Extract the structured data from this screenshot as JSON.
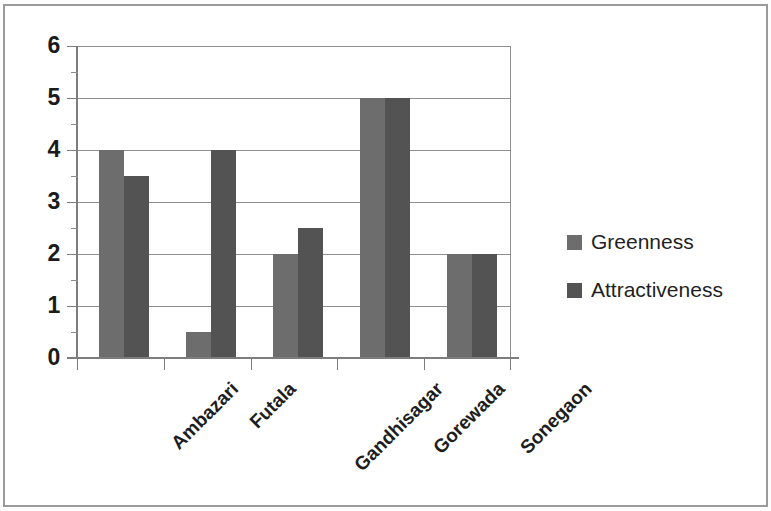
{
  "chart_data": {
    "type": "bar",
    "title": "",
    "subtitle": "",
    "xlabel": "",
    "ylabel": "",
    "categories": [
      "Ambazari",
      "Futala",
      "Gandhisagar",
      "Gorewada",
      "Sonegaon"
    ],
    "series": [
      {
        "name": "Greenness",
        "color": "#6d6d6d",
        "values": [
          4,
          0.5,
          2,
          5,
          2
        ]
      },
      {
        "name": "Attractiveness",
        "color": "#535353",
        "values": [
          3.5,
          4,
          2.5,
          5,
          2
        ]
      }
    ],
    "ylim": [
      0,
      6
    ],
    "y_ticks": [
      0,
      1,
      2,
      3,
      4,
      5,
      6
    ],
    "y_tick_labels": [
      "0",
      "1",
      "2",
      "3",
      "4",
      "5",
      "6"
    ],
    "y_minor_ticks": [
      0.5,
      1.5,
      2.5,
      3.5,
      4.5,
      5.5
    ],
    "grid": true,
    "grid_axis": "y",
    "legend_position": "right",
    "x_tick_label_rotation": -45
  },
  "legend": {
    "items": [
      {
        "label": "Greenness",
        "color": "#6d6d6d"
      },
      {
        "label": "Attractiveness",
        "color": "#535353"
      }
    ]
  },
  "axes": {
    "y_labels": [
      "6",
      "5",
      "4",
      "3",
      "2",
      "1",
      "0"
    ],
    "x_labels": [
      "Ambazari",
      "Futala",
      "Gandhisagar",
      "Gorewada",
      "Sonegaon"
    ]
  }
}
